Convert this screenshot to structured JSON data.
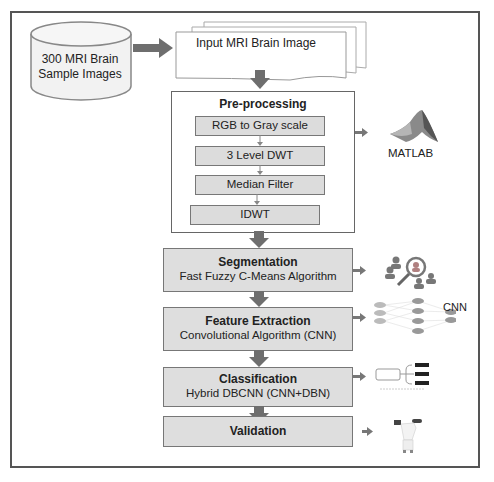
{
  "diagram": {
    "source": {
      "shape": "cylinder",
      "line1": "300 MRI Brain",
      "line2": "Sample Images"
    },
    "input": {
      "shape": "multi-document",
      "label": "Input MRI Brain Image"
    },
    "preprocessing": {
      "title": "Pre-processing",
      "steps": [
        {
          "label": "RGB to Gray scale"
        },
        {
          "label": "3 Level DWT"
        },
        {
          "label": "Median Filter"
        },
        {
          "label": "IDWT"
        }
      ],
      "tool_label": "MATLAB"
    },
    "stages": [
      {
        "title": "Segmentation",
        "subtitle": "Fast Fuzzy C-Means Algorithm",
        "icon": "magnifier-people-icon"
      },
      {
        "title": "Feature Extraction",
        "subtitle": "Convolutional Algorithm (CNN)",
        "icon": "neural-network-icon",
        "icon_label": "CNN"
      },
      {
        "title": "Classification",
        "subtitle": "Hybrid DBCNN (CNN+DBN)",
        "icon": "classifier-tree-icon"
      },
      {
        "title": "Validation",
        "subtitle": "",
        "icon": "doctor-icon"
      }
    ],
    "colors": {
      "frame": "#555555",
      "box_fill": "#dedede",
      "arrow": "#6e6e6e",
      "text": "#222222"
    }
  }
}
